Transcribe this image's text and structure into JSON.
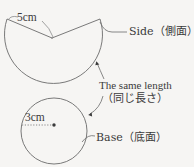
{
  "figure": {
    "type": "geometry-net-diagram",
    "background_color": "#f6f5f3",
    "stroke_color": "#6b6b6b",
    "text_color": "#3b3b3b"
  },
  "labels": {
    "slant_length": "5cm",
    "base_radius": "3cm",
    "side": "Side（側面）",
    "base": "Base（底面）",
    "same_length_en": "The same length",
    "same_length_jp": "（同じ長さ）"
  },
  "shapes": {
    "sector": {
      "apex_x": 52,
      "apex_y": 38,
      "left_end_x": 7,
      "left_end_y": 19,
      "right_end_x": 100,
      "right_end_y": 19,
      "arc_bottom_y": 96,
      "radius_label": "5cm"
    },
    "circle": {
      "center_x": 54,
      "center_y": 131,
      "radius": 33,
      "radius_label": "3cm"
    }
  },
  "annotations": {
    "arrow_upper_target": "sector arc",
    "arrow_lower_target": "base circle circumference"
  }
}
